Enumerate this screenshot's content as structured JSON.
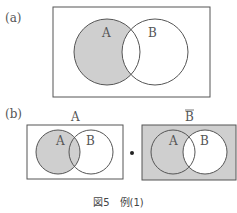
{
  "panel_a": {
    "label": "(a)",
    "circle_a_label": "A",
    "circle_b_label": "B",
    "shaded_region": "A only (A minus B)"
  },
  "panel_b": {
    "label": "(b)",
    "left": {
      "title": "A",
      "circle_a_label": "A",
      "circle_b_label": "B",
      "shaded_region": "A"
    },
    "operator": "•",
    "right": {
      "title": "B",
      "title_overline": true,
      "circle_a_label": "A",
      "circle_b_label": "B",
      "shaded_region": "complement of B"
    }
  },
  "caption": "図5　例(1)",
  "colors": {
    "shade": "#cfcfcf",
    "stroke": "#555555",
    "background": "#ffffff"
  }
}
